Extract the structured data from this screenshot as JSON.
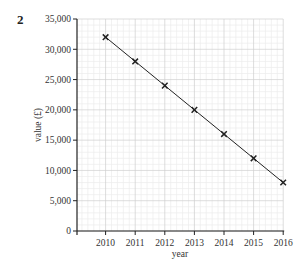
{
  "question_number": "2",
  "chart_data": {
    "type": "line",
    "title": "",
    "xlabel": "year",
    "ylabel": "value (£)",
    "x": [
      2010,
      2011,
      2012,
      2013,
      2014,
      2015,
      2016
    ],
    "categories": [
      "2010",
      "2011",
      "2012",
      "2013",
      "2014",
      "2015",
      "2016"
    ],
    "series": [
      {
        "name": "value",
        "values": [
          32000,
          28000,
          24000,
          20000,
          16000,
          12000,
          8000
        ],
        "marker": "x"
      }
    ],
    "ylim": [
      0,
      35000
    ],
    "xlim": [
      2009.05,
      2016
    ],
    "yticks": [
      0,
      5000,
      10000,
      15000,
      20000,
      25000,
      30000,
      35000
    ],
    "ytick_labels": [
      "0",
      "5,000",
      "10,000",
      "15,000",
      "20,000",
      "25,000",
      "30,000",
      "35,000"
    ],
    "xtick_labels": [
      "2010",
      "2011",
      "2012",
      "2013",
      "2014",
      "2015",
      "2016"
    ],
    "grid": true,
    "legend": "none"
  },
  "colors": {
    "line": "#222222",
    "grid_major": "#cfcfcf",
    "grid_minor": "#ececec",
    "axis": "#222222"
  }
}
